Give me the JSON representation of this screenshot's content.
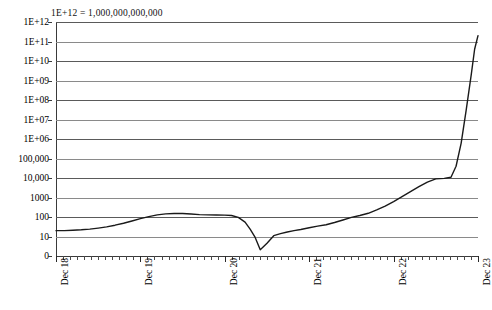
{
  "annotation": "1E+12 = 1,000,000,000,000",
  "chart_data": {
    "type": "line",
    "title": "",
    "subtitle": "",
    "annotation": "1E+12 = 1,000,000,000,000",
    "xlabel": "",
    "ylabel": "",
    "yscale": "log",
    "xscale": "time",
    "grid": true,
    "grid_axis": "y",
    "legend": false,
    "legend_position": "none",
    "line_color": "#1a1a1a",
    "gridline_color": "#5a5a5a",
    "axis_color": "#3a3a3a",
    "background": "#ffffff",
    "ytick_labels": [
      "1E+12",
      "1E+11",
      "1E+10",
      "1E+09",
      "1E+08",
      "1E+07",
      "1E+06",
      "100,000",
      "10,000",
      "1000",
      "100",
      "10",
      "0"
    ],
    "ytick_values": [
      1000000000000,
      100000000000,
      10000000000,
      1000000000,
      100000000,
      10000000,
      1000000,
      100000,
      10000,
      1000,
      100,
      10,
      0
    ],
    "ylim": [
      0,
      1000000000000
    ],
    "xtick_labels": [
      "Dec 18",
      "Dec 19",
      "Dec 20",
      "Dec 21",
      "Dec 22",
      "Dec 23"
    ],
    "xtick_values": [
      0,
      1,
      2,
      3,
      4,
      5
    ],
    "xlim": [
      0,
      5
    ],
    "minor_xticks_per_major": 12,
    "series": [
      {
        "name": "index",
        "x": [
          0.0,
          0.1,
          0.2,
          0.3,
          0.4,
          0.5,
          0.6,
          0.7,
          0.8,
          0.9,
          1.0,
          1.1,
          1.2,
          1.3,
          1.4,
          1.5,
          1.6,
          1.7,
          1.8,
          1.9,
          2.0,
          2.08,
          2.16,
          2.24,
          2.3,
          2.36,
          2.42,
          2.5,
          2.58,
          2.66,
          2.74,
          2.82,
          2.9,
          3.0,
          3.1,
          3.2,
          3.3,
          3.4,
          3.5,
          3.6,
          3.7,
          3.8,
          3.9,
          4.0,
          4.1,
          4.2,
          4.3,
          4.4,
          4.5,
          4.6,
          4.68,
          4.74,
          4.8,
          4.86,
          4.92,
          4.96,
          5.0
        ],
        "y": [
          20,
          20,
          21,
          22,
          24,
          27,
          31,
          38,
          48,
          62,
          82,
          105,
          128,
          145,
          152,
          150,
          142,
          133,
          128,
          126,
          125,
          120,
          95,
          55,
          24,
          9.5,
          3.2,
          6.5,
          11,
          14,
          17,
          20,
          23,
          28,
          34,
          40,
          52,
          70,
          95,
          120,
          155,
          230,
          360,
          620,
          1100,
          2000,
          3600,
          6200,
          9000,
          9600,
          11000,
          40000,
          600000,
          30000000,
          2000000000,
          40000000000,
          200000000000
        ]
      }
    ]
  }
}
